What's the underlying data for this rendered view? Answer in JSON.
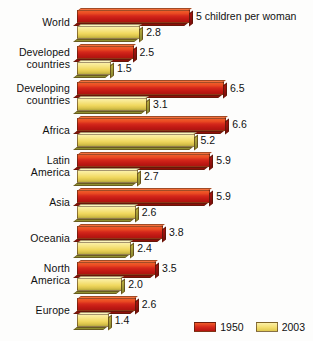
{
  "chart_data": {
    "type": "bar",
    "title": "",
    "subtitle": "",
    "xlabel": "",
    "ylabel": "",
    "orientation": "horizontal",
    "unit_note": "5 children per woman",
    "categories": [
      "World",
      "Developed countries",
      "Developing countries",
      "Africa",
      "Latin America",
      "Asia",
      "Oceania",
      "North America",
      "Europe"
    ],
    "series": [
      {
        "name": "1950",
        "color": "#d5281b",
        "values": [
          5.0,
          2.5,
          6.5,
          6.6,
          5.9,
          5.9,
          3.8,
          3.5,
          2.6
        ]
      },
      {
        "name": "2003",
        "color": "#f3dd6e",
        "values": [
          2.8,
          1.5,
          3.1,
          5.2,
          2.7,
          2.6,
          2.4,
          2.0,
          1.4
        ]
      }
    ],
    "xlim": [
      0,
      7
    ],
    "grid": false,
    "legend_position": "bottom-right"
  },
  "rows": [
    {
      "label_line1": "World",
      "label_line2": "",
      "two_line": false,
      "v1950": 5.0,
      "v2003": 2.8,
      "label1950": "5 children per woman",
      "label2003": "2.8"
    },
    {
      "label_line1": "Developed",
      "label_line2": "countries",
      "two_line": true,
      "v1950": 2.5,
      "v2003": 1.5,
      "label1950": "2.5",
      "label2003": "1.5"
    },
    {
      "label_line1": "Developing",
      "label_line2": "countries",
      "two_line": true,
      "v1950": 6.5,
      "v2003": 3.1,
      "label1950": "6.5",
      "label2003": "3.1"
    },
    {
      "label_line1": "Africa",
      "label_line2": "",
      "two_line": false,
      "v1950": 6.6,
      "v2003": 5.2,
      "label1950": "6.6",
      "label2003": "5.2"
    },
    {
      "label_line1": "Latin",
      "label_line2": "America",
      "two_line": true,
      "v1950": 5.9,
      "v2003": 2.7,
      "label1950": "5.9",
      "label2003": "2.7"
    },
    {
      "label_line1": "Asia",
      "label_line2": "",
      "two_line": false,
      "v1950": 5.9,
      "v2003": 2.6,
      "label1950": "5.9",
      "label2003": "2.6"
    },
    {
      "label_line1": "Oceania",
      "label_line2": "",
      "two_line": false,
      "v1950": 3.8,
      "v2003": 2.4,
      "label1950": "3.8",
      "label2003": "2.4"
    },
    {
      "label_line1": "North",
      "label_line2": "America",
      "two_line": true,
      "v1950": 3.5,
      "v2003": 2.0,
      "label1950": "3.5",
      "label2003": "2.0"
    },
    {
      "label_line1": "Europe",
      "label_line2": "",
      "two_line": false,
      "v1950": 2.6,
      "v2003": 1.4,
      "label1950": "2.6",
      "label2003": "1.4"
    }
  ],
  "legend": {
    "items": [
      {
        "label": "1950",
        "color": "#d5281b",
        "key": "red"
      },
      {
        "label": "2003",
        "color": "#f3dd6e",
        "key": "yel"
      }
    ]
  },
  "scale": {
    "px_per_unit": 22.6,
    "origin_x_px": 75
  }
}
